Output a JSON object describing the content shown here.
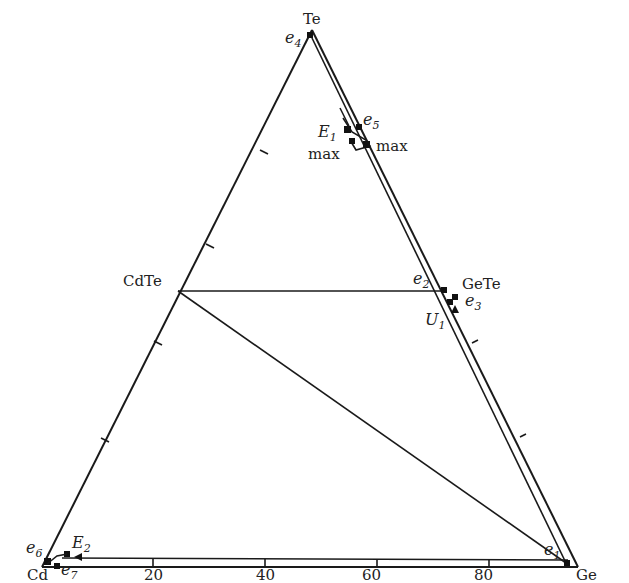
{
  "diagram": {
    "type": "ternary-phase-diagram",
    "vertices": {
      "top": "Te",
      "left": "Cd",
      "right": "Ge"
    },
    "compounds": [
      {
        "id": "cdte",
        "label": "CdTe"
      },
      {
        "id": "gete",
        "label": "GeTe"
      }
    ],
    "bottom_axis_ticks": [
      "20",
      "40",
      "60",
      "80"
    ],
    "points": [
      {
        "id": "e1",
        "base": "e",
        "sub": "1"
      },
      {
        "id": "e2",
        "base": "e",
        "sub": "2"
      },
      {
        "id": "e3",
        "base": "e",
        "sub": "3"
      },
      {
        "id": "e4",
        "base": "e",
        "sub": "4"
      },
      {
        "id": "e5",
        "base": "e",
        "sub": "5"
      },
      {
        "id": "e6",
        "base": "e",
        "sub": "6"
      },
      {
        "id": "e7",
        "base": "e",
        "sub": "7"
      },
      {
        "id": "E1",
        "base": "E",
        "sub": "1"
      },
      {
        "id": "E2",
        "base": "E",
        "sub": "2"
      },
      {
        "id": "U1",
        "base": "U",
        "sub": "1"
      }
    ],
    "max_labels": [
      "max",
      "max"
    ]
  }
}
